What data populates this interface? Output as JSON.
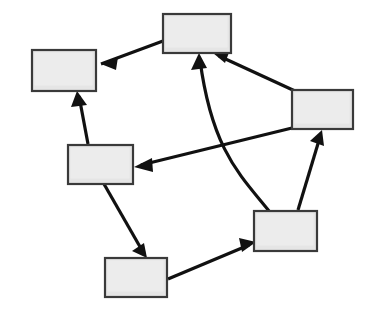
{
  "canvas": {
    "width": 369,
    "height": 315,
    "background": "#ffffff"
  },
  "style": {
    "node_fill": "#e5e5e5",
    "node_stroke": "#3a3a3a",
    "node_stroke_width": 2.2,
    "node_highlight": "#f2f2f2",
    "edge_color": "#111111",
    "edge_width": 3.2,
    "arrowhead_color": "#111111"
  },
  "diagram": {
    "type": "directed-graph",
    "title": "",
    "node_count": 6,
    "edge_count": 8,
    "nodes": [
      {
        "id": "n-top",
        "label": "",
        "x": 163,
        "y": 14,
        "w": 68,
        "h": 39
      },
      {
        "id": "n-top-left",
        "label": "",
        "x": 32,
        "y": 50,
        "w": 64,
        "h": 41
      },
      {
        "id": "n-right",
        "label": "",
        "x": 292,
        "y": 90,
        "w": 61,
        "h": 39
      },
      {
        "id": "n-middle-left",
        "label": "",
        "x": 68,
        "y": 145,
        "w": 65,
        "h": 39
      },
      {
        "id": "n-bottom-right",
        "label": "",
        "x": 254,
        "y": 211,
        "w": 63,
        "h": 40
      },
      {
        "id": "n-bottom",
        "label": "",
        "x": 105,
        "y": 258,
        "w": 62,
        "h": 39
      }
    ],
    "edges": [
      {
        "id": "e-top-to-topleft",
        "from": "n-top",
        "to": "n-top-left",
        "label": "",
        "path": "M 163 41 L 101 64",
        "head": "101,64 118,57 116,70"
      },
      {
        "id": "e-middleleft-to-topleft",
        "from": "n-middle-left",
        "to": "n-top-left",
        "label": "",
        "path": "M 88 144 L 79 96",
        "head": "77,91 87,105 71,107"
      },
      {
        "id": "e-right-to-middleleft",
        "from": "n-right",
        "to": "n-middle-left",
        "label": "",
        "path": "M 292 128 L 141 165",
        "head": "134,167 152,158 153,172"
      },
      {
        "id": "e-right-to-top",
        "from": "n-right",
        "to": "n-top",
        "label": "",
        "path": "M 295 91 L 219 56",
        "head": "213,53 230,50 225,63"
      },
      {
        "id": "e-bottomright-to-top",
        "from": "n-bottom-right",
        "to": "n-top",
        "label": "",
        "path": "M 269 211 C 240 175 212 150 200 60",
        "head": "199,53 207,68 191,70"
      },
      {
        "id": "e-bottomright-to-right",
        "from": "n-bottom-right",
        "to": "n-right",
        "label": "",
        "path": "M 298 210 L 320 137",
        "head": "322,130 324,146 310,141"
      },
      {
        "id": "e-middleleft-to-bottom",
        "from": "n-middle-left",
        "to": "n-bottom",
        "label": "",
        "path": "M 104 184 L 143 252",
        "head": "147,258 132,251 144,243"
      },
      {
        "id": "e-bottom-to-bottomright",
        "from": "n-bottom",
        "to": "n-bottom-right",
        "label": "",
        "path": "M 168 279 L 249 245",
        "head": "256,242 242,252 239,238"
      }
    ]
  }
}
